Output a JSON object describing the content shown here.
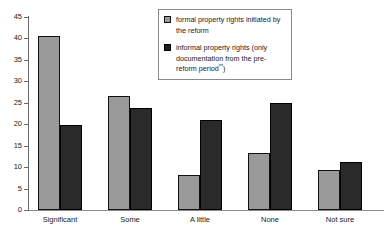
{
  "chart_data": {
    "type": "bar",
    "title": "",
    "xlabel": "",
    "ylabel": "",
    "ylim": [
      0,
      45
    ],
    "yticks": [
      0,
      5,
      10,
      15,
      20,
      25,
      30,
      35,
      40,
      45
    ],
    "grid": false,
    "legend_position": "top-center",
    "categories": [
      "Significant",
      "Some",
      "A little",
      "None",
      "Not sure"
    ],
    "series": [
      {
        "name": "formal property rights initiated by the reform",
        "color": "#9a9a9a",
        "values": [
          40.5,
          26.6,
          8.2,
          13.3,
          9.3
        ]
      },
      {
        "name": "informal property rights (only documentation from the pre-reform period**)",
        "color": "#2a2a2a",
        "values": [
          19.8,
          23.8,
          21.0,
          25.0,
          11.2
        ]
      }
    ]
  },
  "axis": {
    "y_tick_labels": [
      "0",
      "5",
      "10",
      "15",
      "20",
      "25",
      "30",
      "35",
      "40",
      "45"
    ]
  },
  "legend": {
    "entries": [
      {
        "label": "formal property rights initiated by the reform",
        "swatch": "light-grey-swatch"
      },
      {
        "label_main": "informal property rights (only documentation from the pre-reform period",
        "label_sup": "**",
        "label_tail": ")",
        "swatch": "dark-swatch"
      }
    ]
  }
}
